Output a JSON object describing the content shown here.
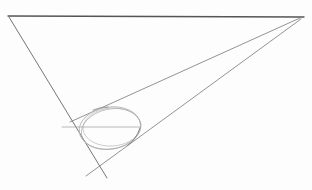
{
  "drawing": {
    "subject": "pencil perspective sketch",
    "elements": [
      {
        "name": "horizon-line",
        "kind": "line"
      },
      {
        "name": "left-edge-line",
        "kind": "line"
      },
      {
        "name": "upper-perspective-line",
        "kind": "line"
      },
      {
        "name": "lower-perspective-line",
        "kind": "line"
      },
      {
        "name": "ellipse-guide-line",
        "kind": "line"
      },
      {
        "name": "ellipse-sketch",
        "kind": "ellipse"
      }
    ],
    "colors": {
      "paper": "#fdfdfd",
      "dark_graphite": "#5a5a5a",
      "medium_graphite": "#777777",
      "light_graphite": "#b8b8b8"
    }
  }
}
